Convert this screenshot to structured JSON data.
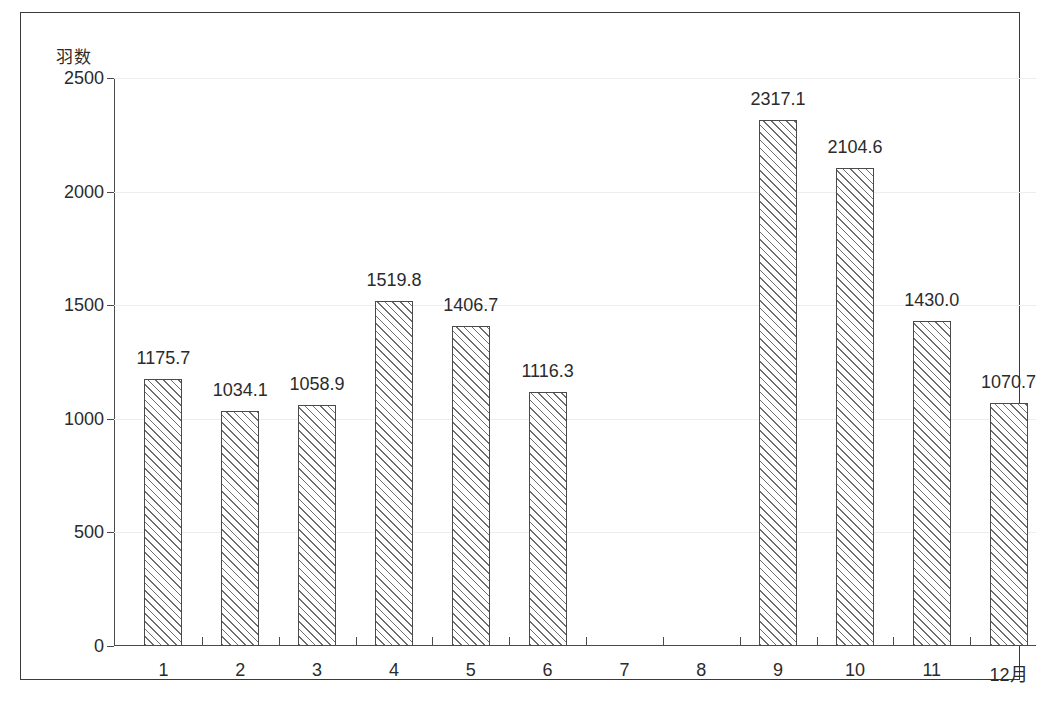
{
  "chart_data": {
    "type": "bar",
    "title": "",
    "subtitle": "",
    "xlabel": "",
    "ylabel": "羽数",
    "categories": [
      "1",
      "2",
      "3",
      "4",
      "5",
      "6",
      "7",
      "8",
      "9",
      "10",
      "11",
      "12月"
    ],
    "values": [
      1175.7,
      1034.1,
      1058.9,
      1519.8,
      1406.7,
      1116.3,
      null,
      null,
      2317.1,
      2104.6,
      1430.0,
      1070.7
    ],
    "data_labels": [
      "1175.7",
      "1034.1",
      "1058.9",
      "1519.8",
      "1406.7",
      "1116.3",
      "",
      "",
      "2317.1",
      "2104.6",
      "1430.0",
      "1070.7"
    ],
    "ylim": [
      0,
      2500
    ],
    "ytick_values": [
      0,
      500,
      1000,
      1500,
      2000,
      2500
    ],
    "ytick_labels": [
      "0",
      "500",
      "1000",
      "1500",
      "2000",
      "2500"
    ],
    "grid": true,
    "grid_axis": "y",
    "legend": false,
    "legend_position": "none",
    "bar_fill": "diagonal-hatch",
    "bar_edge_color": "#4a4a4a",
    "grid_color": "#ededed",
    "axis_color": "#4a4a4a",
    "text_color": "#2b2b2b",
    "background_color": "#ffffff"
  },
  "figure": {
    "y_axis_caption": "羽数",
    "caption": ""
  }
}
